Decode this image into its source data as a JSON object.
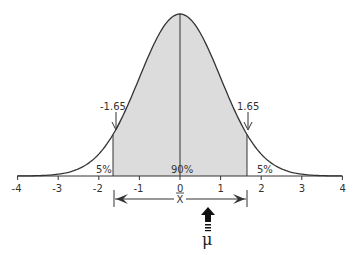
{
  "chart_data": {
    "type": "area",
    "title": "",
    "xlabel": "",
    "ylabel": "",
    "xlim": [
      -4,
      4
    ],
    "x_ticks": [
      "-4",
      "-3",
      "-2",
      "-1",
      "0",
      "1",
      "2",
      "3",
      "4"
    ],
    "grid": false,
    "series": [
      {
        "name": "normal-pdf",
        "mean": 0,
        "sd": 1
      }
    ],
    "shaded_region": {
      "from": -1.65,
      "to": 1.65,
      "label": "90%",
      "color": "#dcdcdc"
    },
    "tails": [
      {
        "side": "left",
        "label": "5%"
      },
      {
        "side": "right",
        "label": "5%"
      }
    ],
    "critical_values": [
      {
        "value": -1.65,
        "label": "-1.65"
      },
      {
        "value": 1.65,
        "label": "1.65"
      }
    ],
    "interval": {
      "from": -1.65,
      "to": 1.65,
      "center_label": "X̄"
    },
    "mu_marker": {
      "value": 0.7,
      "label": "μ"
    }
  },
  "labels": {
    "left_crit": "-1.65",
    "right_crit": "1.65",
    "left_tail": "5%",
    "right_tail": "5%",
    "center_area": "90%",
    "xbar": "X",
    "mu": "μ",
    "ticks": [
      "-4",
      "-3",
      "-2",
      "-1",
      "0",
      "1",
      "2",
      "3",
      "4"
    ]
  },
  "colors": {
    "shade": "#dcdcdc",
    "line": "#333333"
  }
}
